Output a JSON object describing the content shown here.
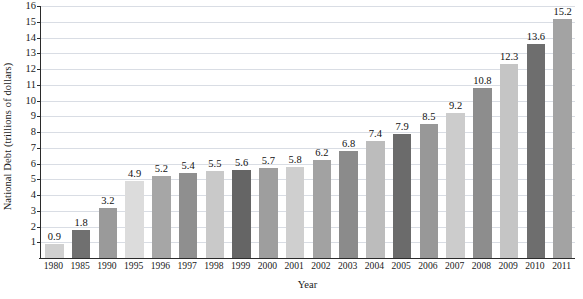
{
  "chart_data": {
    "type": "bar",
    "title": "",
    "xlabel": "Year",
    "ylabel": "National Debt (trillions of dollars)",
    "categories": [
      "1980",
      "1985",
      "1990",
      "1995",
      "1996",
      "1997",
      "1998",
      "1999",
      "2000",
      "2001",
      "2002",
      "2003",
      "2004",
      "2005",
      "2006",
      "2007",
      "2008",
      "2009",
      "2010",
      "2011"
    ],
    "values": [
      0.9,
      1.8,
      3.2,
      4.9,
      5.2,
      5.4,
      5.5,
      5.6,
      5.7,
      5.8,
      6.2,
      6.8,
      7.4,
      7.9,
      8.5,
      9.2,
      10.8,
      12.3,
      13.6,
      15.2
    ],
    "value_labels": [
      "0.9",
      "1.8",
      "3.2",
      "4.9",
      "5.2",
      "5.4",
      "5.5",
      "5.6",
      "5.7",
      "5.8",
      "6.2",
      "6.8",
      "7.4",
      "7.9",
      "8.5",
      "9.2",
      "10.8",
      "12.3",
      "13.6",
      "15.2"
    ],
    "bar_colors": [
      "#d0d0d0",
      "#707070",
      "#9a9a9a",
      "#dcdcdc",
      "#a6a6a6",
      "#8f8f8f",
      "#c9c9c9",
      "#656565",
      "#9e9e9e",
      "#cfcfcf",
      "#a2a2a2",
      "#8b8b8b",
      "#bcbcbc",
      "#6b6b6b",
      "#989898",
      "#cccccc",
      "#8d8d8d",
      "#c5c5c5",
      "#6e6e6e",
      "#a3a3a3"
    ],
    "ytick_labels": [
      "16",
      "15",
      "14",
      "13",
      "12",
      "11",
      "10",
      "9",
      "8",
      "7",
      "6",
      "5",
      "4",
      "3",
      "2",
      "1"
    ],
    "ytick_values": [
      16,
      15,
      14,
      13,
      12,
      11,
      10,
      9,
      8,
      7,
      6,
      5,
      4,
      3,
      2,
      1
    ],
    "ylim": [
      0,
      16
    ],
    "grid": "horizontal",
    "grid_color": "#d9dde4",
    "axis_color": "#2b2b2b",
    "legend": "none",
    "background": "#ffffff"
  }
}
